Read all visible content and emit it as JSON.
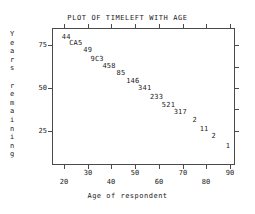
{
  "chart_data": {
    "type": "scatter",
    "title": "PLOT OF TIMELEFT WITH AGE",
    "xlabel": "Age of respondent",
    "ylabel": "Years remaining",
    "xlim": [
      15,
      92
    ],
    "ylim": [
      5,
      85
    ],
    "grid": false,
    "legend": null,
    "note": "Character plot: each marker is a count/overstrike code rather than a dot. 'C' denotes a count of 12 and 'A' a count of 10 in SAS overprint notation.",
    "xticks": [
      {
        "value": 20,
        "label": "20",
        "row": "lower"
      },
      {
        "value": 30,
        "label": "30",
        "row": "upper"
      },
      {
        "value": 40,
        "label": "40",
        "row": "lower"
      },
      {
        "value": 50,
        "label": "50",
        "row": "upper"
      },
      {
        "value": 60,
        "label": "60",
        "row": "lower"
      },
      {
        "value": 70,
        "label": "70",
        "row": "upper"
      },
      {
        "value": 80,
        "label": "80",
        "row": "lower"
      },
      {
        "value": 90,
        "label": "90",
        "row": "upper"
      }
    ],
    "yticks": [
      {
        "value": 75,
        "label": "75"
      },
      {
        "value": 50,
        "label": "50"
      },
      {
        "value": 25,
        "label": "25"
      }
    ],
    "points": [
      {
        "label": "44",
        "x": 21,
        "y": 80
      },
      {
        "label": "CA5",
        "x": 25,
        "y": 76
      },
      {
        "label": "49",
        "x": 30,
        "y": 72
      },
      {
        "label": "9C3",
        "x": 34,
        "y": 67
      },
      {
        "label": "458",
        "x": 39,
        "y": 63
      },
      {
        "label": "85",
        "x": 44,
        "y": 59
      },
      {
        "label": "146",
        "x": 49,
        "y": 54
      },
      {
        "label": "341",
        "x": 54,
        "y": 50
      },
      {
        "label": "233",
        "x": 59,
        "y": 45
      },
      {
        "label": "521",
        "x": 64,
        "y": 40
      },
      {
        "label": "317",
        "x": 69,
        "y": 36
      },
      {
        "label": "2",
        "x": 75,
        "y": 31
      },
      {
        "label": "11",
        "x": 79,
        "y": 26
      },
      {
        "label": "2",
        "x": 83,
        "y": 22
      },
      {
        "label": "1",
        "x": 89,
        "y": 16
      }
    ]
  },
  "y_axis_title_chars": [
    "Y",
    "e",
    "a",
    "r",
    "s",
    "",
    "r",
    "e",
    "m",
    "a",
    "i",
    "n",
    "i",
    "n",
    "g"
  ]
}
